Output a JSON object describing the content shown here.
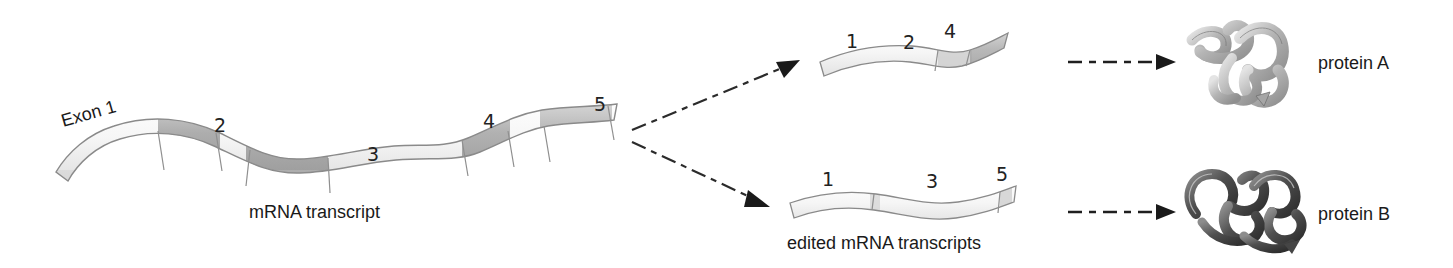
{
  "figure": {
    "background_color": "#ffffff",
    "ink_color": "#1a1a1a"
  },
  "primary_transcript": {
    "caption": "mRNA transcript",
    "first_exon_label": "Exon 1",
    "exon_numbers": [
      "2",
      "3",
      "4",
      "5"
    ],
    "segment_colors": {
      "exon_light": "#f2f2f2",
      "intron_dark": "#b9b9b9",
      "outline": "#8a8a8a"
    }
  },
  "edited_transcripts": {
    "caption": "edited mRNA transcripts",
    "top": {
      "exon_numbers": [
        "1",
        "2",
        "4"
      ]
    },
    "bottom": {
      "exon_numbers": [
        "1",
        "3",
        "5"
      ]
    }
  },
  "products": {
    "top": {
      "label": "protein A",
      "ribbon_color": "#b0b0b0"
    },
    "bottom": {
      "label": "protein B",
      "ribbon_color": "#5c5c5c"
    }
  },
  "arrows": {
    "branch_up": "branch-arrow-up",
    "branch_down": "branch-arrow-down",
    "translate_top": "translation-arrow-top",
    "translate_bottom": "translation-arrow-bottom"
  }
}
